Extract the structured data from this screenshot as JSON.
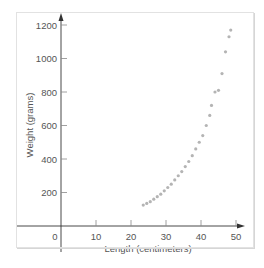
{
  "chart_data": {
    "type": "scatter",
    "title": "",
    "xlabel": "Length (centimeters)",
    "ylabel": "Weight (grams)",
    "xlim": [
      -15,
      52
    ],
    "ylim": [
      -140,
      1260
    ],
    "x_ticks": [
      0,
      10,
      20,
      30,
      40,
      50
    ],
    "y_ticks": [
      200,
      400,
      600,
      800,
      1000,
      1200
    ],
    "grid": false,
    "legend": null,
    "point_color": "#b4b4b4",
    "axis_color": "#333333",
    "series": [
      {
        "name": "fish",
        "points": [
          [
            23.5,
            125
          ],
          [
            24.5,
            135
          ],
          [
            25.5,
            145
          ],
          [
            26.5,
            160
          ],
          [
            27.5,
            175
          ],
          [
            28.5,
            190
          ],
          [
            29.5,
            210
          ],
          [
            30.5,
            230
          ],
          [
            31.5,
            250
          ],
          [
            32.5,
            275
          ],
          [
            33.5,
            300
          ],
          [
            34.5,
            325
          ],
          [
            35.5,
            355
          ],
          [
            36.5,
            385
          ],
          [
            37.5,
            420
          ],
          [
            38.5,
            460
          ],
          [
            39.5,
            500
          ],
          [
            40.5,
            540
          ],
          [
            41.5,
            600
          ],
          [
            42.5,
            660
          ],
          [
            43.0,
            720
          ],
          [
            44.0,
            800
          ],
          [
            45.0,
            810
          ],
          [
            46.0,
            910
          ],
          [
            47.0,
            1040
          ],
          [
            48.0,
            1130
          ],
          [
            48.5,
            1170
          ]
        ]
      }
    ]
  }
}
